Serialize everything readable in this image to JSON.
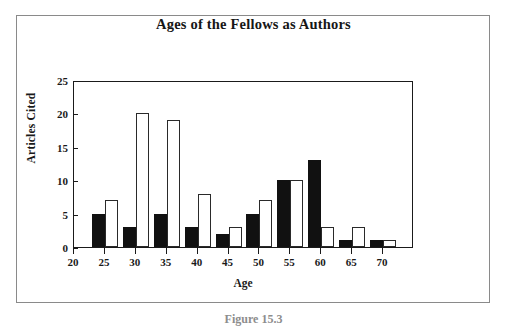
{
  "figure": {
    "caption": "Figure 15.3"
  },
  "chart_data": {
    "type": "bar",
    "title": "Ages of the Fellows as Authors",
    "xlabel": "Age",
    "ylabel": "Articles Cited",
    "categories": [
      "20",
      "25",
      "30",
      "35",
      "40",
      "45",
      "50",
      "55",
      "60",
      "65",
      "70"
    ],
    "series": [
      {
        "name": "filled",
        "style": "solid-black",
        "values": [
          0,
          5,
          3,
          5,
          3,
          2,
          5,
          10,
          13,
          1,
          1
        ]
      },
      {
        "name": "hollow",
        "style": "white-outline",
        "values": [
          0,
          7,
          20,
          19,
          8,
          3,
          7,
          10,
          3,
          3,
          1
        ]
      }
    ],
    "xlim": [
      20,
      75
    ],
    "ylim": [
      0,
      25
    ],
    "yticks": [
      0,
      5,
      10,
      15,
      20,
      25
    ],
    "xticks": [
      20,
      25,
      30,
      35,
      40,
      45,
      50,
      55,
      60,
      65,
      70
    ],
    "grid": false,
    "legend": "none"
  },
  "colors": {
    "bar_filled": "#111111",
    "bar_hollow_fill": "#ffffff",
    "bar_hollow_stroke": "#2a2a2a",
    "axis": "#1a1a1a",
    "frame": "#8a8a8a",
    "text": "#161616"
  }
}
